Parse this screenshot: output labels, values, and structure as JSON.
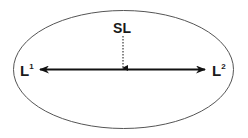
{
  "diagram": {
    "labels": {
      "top": "SL",
      "left_main": "L",
      "left_sup": "1",
      "right_main": "L",
      "right_sup": "2"
    },
    "colors": {
      "ellipse_stroke": "#555555",
      "arrow": "#111111",
      "text": "#1a1a1a",
      "background": "#ffffff"
    },
    "elements": {
      "ellipse": "enclosing oval",
      "double_arrow": "horizontal bidirectional arrow between L1 and L2",
      "dotted_arrow": "dotted downward arrow from SL to the midpoint of the double arrow"
    }
  }
}
